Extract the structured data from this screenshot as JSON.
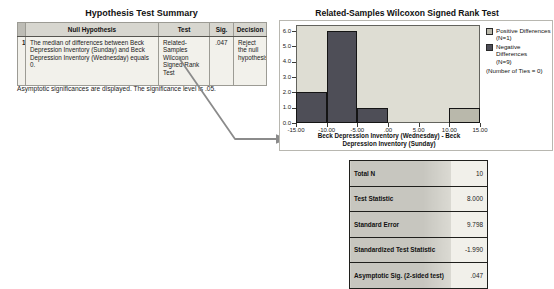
{
  "hypothesis_table": {
    "title": "Hypothesis Test Summary",
    "columns": [
      "Null Hypothesis",
      "Test",
      "Sig.",
      "Decision"
    ],
    "rows": [
      {
        "index": "1",
        "null_hypothesis": "The median of differences between Beck Depression Inventory (Sunday) and Beck Depression Inventory (Wednesday) equals 0.",
        "test": "Related-Samples Wilcoxon Signed Rank Test",
        "sig": ".047",
        "decision": "Reject the null hypothesis."
      }
    ],
    "footnote": "Asymptotic significances are displayed. The significance level is .05."
  },
  "chart_data": {
    "type": "bar",
    "title": "Related-Samples Wilcoxon Signed Rank Test",
    "xlabel": "Beck Depression Inventory (Wednesday) - Beck Depression Inventory (Sunday)",
    "ylabel": "Frequency",
    "xlim": [
      -15,
      15
    ],
    "ylim": [
      0,
      6.4
    ],
    "grid": false,
    "x_ticks": [
      "-15.00",
      "-10.00",
      "-5.00",
      ".00",
      "5.00",
      "10.00",
      "15.00"
    ],
    "y_ticks": [
      "0.0",
      "1.0",
      "2.0",
      "3.0",
      "4.0",
      "5.0",
      "6.0"
    ],
    "bin_width": 5,
    "series": [
      {
        "name": "Negative Differences",
        "color": "#4e4e57",
        "bins": [
          {
            "x0": -15,
            "x1": -10,
            "freq": 2
          },
          {
            "x0": -10,
            "x1": -5,
            "freq": 6
          },
          {
            "x0": -5,
            "x1": 0,
            "freq": 1
          }
        ]
      },
      {
        "name": "Positive Differences",
        "color": "#b9b8ab",
        "bins": [
          {
            "x0": 10,
            "x1": 15,
            "freq": 1
          }
        ]
      }
    ],
    "legend_position": "right",
    "legend": [
      {
        "label": "Positive Differences",
        "sub": "(N=1)",
        "color": "#b9b8ab"
      },
      {
        "label": "Negative Differences",
        "sub": "(N=9)",
        "color": "#4e4e57"
      }
    ],
    "legend_note": "(Number of Ties = 0)"
  },
  "stats_table": {
    "rows": [
      {
        "label": "Total N",
        "value": "10"
      },
      {
        "label": "Test Statistic",
        "value": "8.000"
      },
      {
        "label": "Standard Error",
        "value": "9.798"
      },
      {
        "label": "Standardized Test Statistic",
        "value": "-1.990"
      },
      {
        "label": "Asymptotic Sig. (2-sided test)",
        "value": ".047"
      }
    ]
  },
  "colors": {
    "plot_background": "#deddd3",
    "negative_bar": "#4e4e57",
    "positive_bar": "#b9b8ab",
    "table_header": "#d7d6cf",
    "decision_cell": "#bab9b2",
    "arrow": "#8b8b8b"
  }
}
